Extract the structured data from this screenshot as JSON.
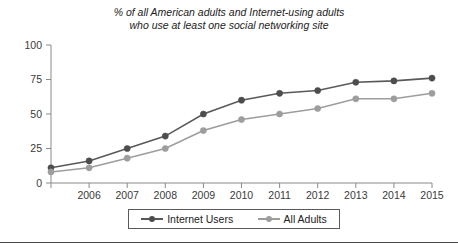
{
  "chart_data": {
    "type": "line",
    "title": "% of all American adults and Internet-using adults who use at least one social networking site",
    "title_lines": [
      "% of all American adults and Internet-using adults",
      "who use at least one social networking site"
    ],
    "xlabel": "",
    "ylabel": "",
    "x": [
      2005,
      2006,
      2007,
      2008,
      2009,
      2010,
      2011,
      2012,
      2013,
      2014,
      2015
    ],
    "categories": [
      "",
      "2006",
      "2007",
      "2008",
      "2009",
      "2010",
      "2011",
      "2012",
      "2013",
      "2014",
      "2015"
    ],
    "xtick_labels": [
      "2006",
      "2007",
      "2008",
      "2009",
      "2010",
      "2011",
      "2012",
      "2013",
      "2014",
      "2015"
    ],
    "ytick_labels": [
      "0",
      "25",
      "50",
      "75",
      "100"
    ],
    "yticks": [
      0,
      25,
      50,
      75,
      100
    ],
    "ylim": [
      0,
      100
    ],
    "xlim": [
      2005,
      2015
    ],
    "grid": false,
    "legend_position": "bottom",
    "series": [
      {
        "name": "Internet Users",
        "color": "#595959",
        "values": [
          11,
          16,
          25,
          34,
          50,
          60,
          65,
          67,
          73,
          74,
          76
        ]
      },
      {
        "name": "All Adults",
        "color": "#9d9d9d",
        "values": [
          8,
          11,
          18,
          25,
          38,
          46,
          50,
          54,
          61,
          61,
          65
        ]
      }
    ]
  },
  "legend": {
    "items": [
      {
        "label": "Internet Users"
      },
      {
        "label": "All Adults"
      }
    ]
  }
}
